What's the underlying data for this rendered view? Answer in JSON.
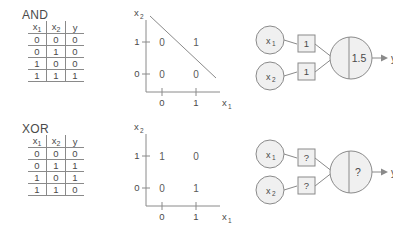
{
  "figure": {
    "axis_x_label": "x",
    "axis_x_sub": "1",
    "axis_y_label": "x",
    "axis_y_sub": "2",
    "tick_0": "0",
    "tick_1": "1",
    "output_label": "y",
    "stroke_color": "#8a8a8a",
    "fill_color": "#f0f0f0",
    "text_color": "#4a4a4a"
  },
  "table_headers": {
    "c1": "x",
    "c1sub": "1",
    "c2": "x",
    "c2sub": "2",
    "c3": "y"
  },
  "gates": [
    {
      "id": "and",
      "title": "AND",
      "truth_table": {
        "headers": [
          "x1",
          "x2",
          "y"
        ],
        "rows": [
          [
            "0",
            "0",
            "0"
          ],
          [
            "0",
            "1",
            "0"
          ],
          [
            "1",
            "0",
            "0"
          ],
          [
            "1",
            "1",
            "1"
          ]
        ]
      },
      "plot": {
        "points": [
          {
            "x": 0,
            "y": 1,
            "label": "0"
          },
          {
            "x": 1,
            "y": 1,
            "label": "1"
          },
          {
            "x": 0,
            "y": 0,
            "label": "0"
          },
          {
            "x": 1,
            "y": 0,
            "label": "0"
          }
        ],
        "separable": true,
        "decision_line": true
      },
      "network": {
        "inputs": [
          {
            "label": "x",
            "sub": "1"
          },
          {
            "label": "x",
            "sub": "2"
          }
        ],
        "weights": [
          "1",
          "1"
        ],
        "threshold": "1.5",
        "output": "y"
      }
    },
    {
      "id": "xor",
      "title": "XOR",
      "truth_table": {
        "headers": [
          "x1",
          "x2",
          "y"
        ],
        "rows": [
          [
            "0",
            "0",
            "0"
          ],
          [
            "0",
            "1",
            "1"
          ],
          [
            "1",
            "0",
            "1"
          ],
          [
            "1",
            "1",
            "0"
          ]
        ]
      },
      "plot": {
        "points": [
          {
            "x": 0,
            "y": 1,
            "label": "1"
          },
          {
            "x": 1,
            "y": 1,
            "label": "0"
          },
          {
            "x": 0,
            "y": 0,
            "label": "0"
          },
          {
            "x": 1,
            "y": 0,
            "label": "1"
          }
        ],
        "separable": false,
        "decision_line": false
      },
      "network": {
        "inputs": [
          {
            "label": "x",
            "sub": "1"
          },
          {
            "label": "x",
            "sub": "2"
          }
        ],
        "weights": [
          "?",
          "?"
        ],
        "threshold": "?",
        "output": "y"
      }
    }
  ]
}
